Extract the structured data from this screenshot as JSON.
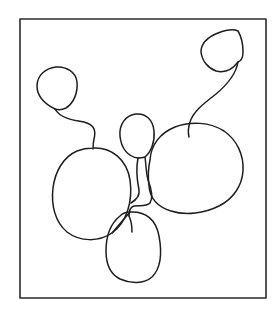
{
  "drawing": {
    "background": "#ffffff",
    "ink_color": "#1e1e1e",
    "frame": {
      "x": 20,
      "y": 19,
      "width": 246,
      "height": 279,
      "stroke": "#2a2a2a",
      "stroke_width": 1.6
    },
    "stroke_width": 1.5,
    "shapes": [
      {
        "name": "loop-top-left",
        "d": "M55,109 C45,104 37,96 37,86 C37,75 46,68 56,67 C66,66 76,72 77,82 C78,92 74,103 66,108 C62,110 58,110 55,109 Z"
      },
      {
        "name": "connector-top-left-to-left-loop",
        "d": "M55,109 C60,118 72,120 84,122 C95,125 96,131 94,139 C93,143 93,146 93,149"
      },
      {
        "name": "loop-top-right",
        "d": "M238,62 C232,70 224,73 216,71 C208,68 202,61 201,52 C201,43 208,37 218,33 C226,30 234,29 238,31 C241,36 243,45 243,52 C243,58 241,61 238,62 Z"
      },
      {
        "name": "connector-top-right-to-right-loop",
        "d": "M238,62 C236,74 228,84 216,94 C203,104 193,112 190,122 C188,128 188,133 189,137"
      },
      {
        "name": "loop-middle-small",
        "d": "M138,158 C128,157 121,148 120,136 C119,124 126,115 136,114 C146,113 153,120 154,131 C155,142 151,152 145,157 C142,158 140,158 138,158 Z"
      },
      {
        "name": "loop-right-large",
        "d": "M150,160 C151,145 160,133 175,127 C190,121 210,122 224,131 C237,140 244,155 243,171 C242,186 233,199 219,206 C205,213 186,216 171,211 C158,207 150,198 149,186 C148,178 148,169 150,160 Z"
      },
      {
        "name": "tangle-middle-to-right",
        "d": "M145,157 C146,164 146,172 148,180 C152,190 153,198 150,203 C146,207 140,205 134,206 C130,207 129,212 129,216"
      },
      {
        "name": "tangle-middle-down",
        "d": "M138,158 C136,168 137,180 139,190 C140,196 136,200 131,203"
      },
      {
        "name": "loop-left-large",
        "d": "M93,148 C112,147 127,160 130,180 C133,201 127,222 112,233 C99,242 80,242 67,232 C55,222 51,205 53,188 C55,172 63,157 77,151 C82,149 88,148 93,148 Z"
      },
      {
        "name": "loop-bottom",
        "d": "M130,212 C146,211 156,220 159,236 C162,252 161,268 152,277 C144,284 131,284 120,279 C110,274 106,264 106,251 C106,238 110,224 120,216 C123,213 127,212 130,212 Z"
      },
      {
        "name": "tangle-bottom-stem",
        "d": "M129,216 C131,220 132,226 132,232"
      },
      {
        "name": "tangle-left-to-bottom",
        "d": "M112,233 C118,226 124,219 130,212"
      }
    ]
  }
}
